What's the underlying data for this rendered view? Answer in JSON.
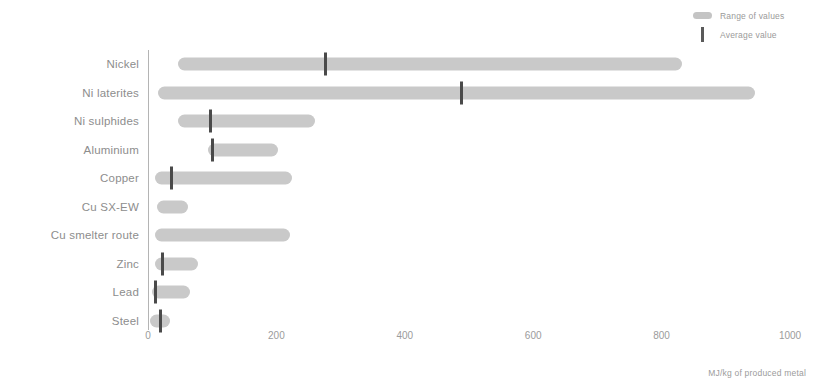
{
  "legend": {
    "items": [
      {
        "label": "Range of values",
        "marker": "range-pill",
        "color": "#c4c4c4"
      },
      {
        "label": "Average value",
        "marker": "average-bar",
        "color": "#5a5a5a"
      }
    ]
  },
  "axis": {
    "x_title": "MJ/kg of produced metal",
    "ticks": [
      "0",
      "200",
      "400",
      "600",
      "800",
      "1000"
    ]
  },
  "colors": {
    "range_bar": "#c9c9c9",
    "average_mark": "#4a4a4a",
    "axis": "#b4b4b4",
    "text": "#8d8d8d"
  },
  "chart_data": {
    "type": "bar",
    "title": "",
    "subtitle": "",
    "xlabel": "MJ/kg of produced metal",
    "ylabel": "",
    "xlim": [
      0,
      1000
    ],
    "xticks": [
      0,
      200,
      400,
      600,
      800,
      1000
    ],
    "grid": false,
    "legend_position": "top-right",
    "orientation": "horizontal",
    "categories": [
      "Nickel",
      "Ni laterites",
      "Ni sulphides",
      "Aluminium",
      "Copper",
      "Cu SX-EW",
      "Cu smelter route",
      "Zinc",
      "Lead",
      "Steel"
    ],
    "series": [
      {
        "name": "Range of values",
        "type": "range",
        "ranges": [
          {
            "category": "Nickel",
            "low": 47,
            "high": 832
          },
          {
            "category": "Ni laterites",
            "low": 16,
            "high": 945
          },
          {
            "category": "Ni sulphides",
            "low": 47,
            "high": 260
          },
          {
            "category": "Aluminium",
            "low": 94,
            "high": 202
          },
          {
            "category": "Copper",
            "low": 11,
            "high": 224
          },
          {
            "category": "Cu SX-EW",
            "low": 14,
            "high": 62
          },
          {
            "category": "Cu smelter route",
            "low": 11,
            "high": 221
          },
          {
            "category": "Zinc",
            "low": 11,
            "high": 78
          },
          {
            "category": "Lead",
            "low": 6,
            "high": 65
          },
          {
            "category": "Steel",
            "low": 3,
            "high": 34
          }
        ]
      },
      {
        "name": "Average value",
        "type": "marker",
        "values": [
          {
            "category": "Nickel",
            "value": 276
          },
          {
            "category": "Ni laterites",
            "value": 488
          },
          {
            "category": "Ni sulphides",
            "value": 97
          },
          {
            "category": "Aluminium",
            "value": 100
          },
          {
            "category": "Copper",
            "value": 37
          },
          {
            "category": "Cu SX-EW",
            "value": null
          },
          {
            "category": "Cu smelter route",
            "value": null
          },
          {
            "category": "Zinc",
            "value": 23
          },
          {
            "category": "Lead",
            "value": 11
          },
          {
            "category": "Steel",
            "value": 20
          }
        ]
      }
    ]
  }
}
